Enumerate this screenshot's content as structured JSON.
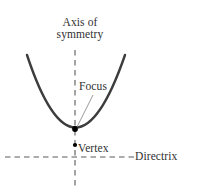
{
  "figure": {
    "type": "geometry-diagram",
    "background_color": "#ffffff",
    "width": 198,
    "height": 193
  },
  "labels": {
    "axis_of_symmetry_line1": "Axis of",
    "axis_of_symmetry_line2": "symmetry",
    "focus": "Focus",
    "vertex": "Vertex",
    "directrix": "Directrix"
  },
  "colors": {
    "curve": "#3d3d3d",
    "dashed_line": "#5a5a5a",
    "leader_line": "#8a8a8a",
    "text": "#303030",
    "point": "#000000"
  },
  "geometry": {
    "vertex_point": {
      "x": 75,
      "y": 145
    },
    "focus_point": {
      "x": 75,
      "y": 129
    },
    "axis_of_symmetry": {
      "x": 75,
      "y_top": 50,
      "y_bottom": 190
    },
    "directrix": {
      "y": 157,
      "x_left": 5,
      "x_right": 134
    },
    "parabola": {
      "left_end": {
        "x": 27,
        "y": 55
      },
      "right_end": {
        "x": 125,
        "y": 55
      },
      "control": {
        "x": 75,
        "y": 200
      }
    },
    "focus_leader_line": {
      "x1": 93,
      "y1": 95,
      "x2": 77,
      "y2": 127
    }
  }
}
